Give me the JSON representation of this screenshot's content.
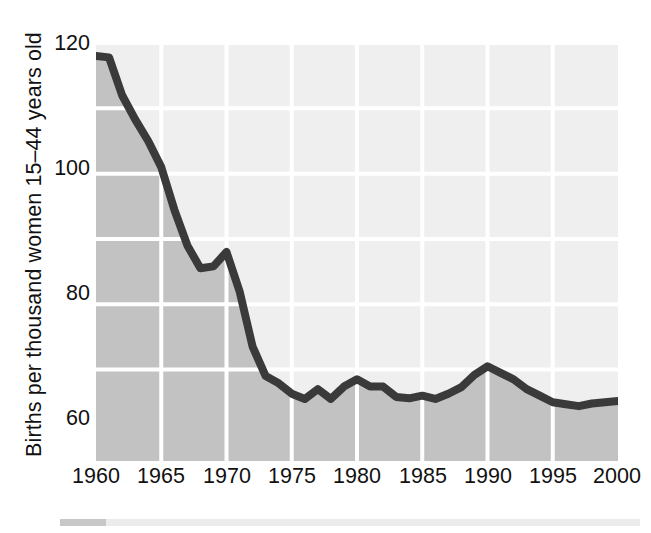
{
  "chart_data": {
    "type": "area",
    "title": "",
    "subtitle": "",
    "xlabel": "",
    "ylabel": "Births per thousand women 15–44 years old",
    "xlim": [
      1960,
      2000
    ],
    "ylim": [
      56,
      120
    ],
    "ytick_values": [
      60,
      80,
      100,
      120
    ],
    "ytick_labels": [
      "60",
      "80",
      "100",
      "120"
    ],
    "xtick_values": [
      1960,
      1965,
      1970,
      1975,
      1980,
      1985,
      1990,
      1995,
      2000
    ],
    "xtick_labels": [
      "1960",
      "1965",
      "1970",
      "1975",
      "1980",
      "1985",
      "1990",
      "1995",
      "2000"
    ],
    "gridlines": {
      "horizontal_values": [
        70,
        80,
        90,
        100,
        110,
        120
      ],
      "vertical_values": [
        1965,
        1970,
        1975,
        1980,
        1985,
        1990,
        1995
      ],
      "color": "#ffffff",
      "on": true
    },
    "legend": null,
    "colors": {
      "line": "#3a3a3a",
      "fill_below": "#c2c2c2",
      "fill_above": "#efefef",
      "grid": "#ffffff",
      "text": "#111111"
    },
    "x": [
      1960,
      1961,
      1962,
      1963,
      1964,
      1965,
      1966,
      1967,
      1968,
      1969,
      1970,
      1971,
      1972,
      1973,
      1974,
      1975,
      1976,
      1977,
      1978,
      1979,
      1980,
      1981,
      1982,
      1983,
      1984,
      1985,
      1986,
      1987,
      1988,
      1989,
      1990,
      1991,
      1992,
      1993,
      1994,
      1995,
      1996,
      1997,
      1998,
      1999,
      2000
    ],
    "values": [
      118.0,
      117.8,
      112.0,
      108.3,
      105.0,
      101.0,
      94.5,
      89.0,
      85.5,
      85.8,
      88.0,
      82.0,
      73.5,
      69.0,
      67.9,
      66.3,
      65.5,
      67.0,
      65.5,
      67.4,
      68.5,
      67.4,
      67.4,
      65.8,
      65.6,
      66.0,
      65.5,
      66.3,
      67.3,
      69.2,
      70.5,
      69.5,
      68.5,
      67.0,
      66.0,
      65.0,
      64.7,
      64.4,
      64.8,
      65.0,
      65.2
    ],
    "series_name": "General fertility rate"
  },
  "axis": {
    "y_label": "Births per thousand women 15–44 years old"
  }
}
